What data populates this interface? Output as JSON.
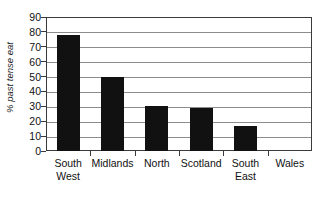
{
  "chart_data": {
    "type": "bar",
    "title": "",
    "subtitle": "",
    "xlabel": "",
    "ylabel": "% past tense eat",
    "categories": [
      "South West",
      "Midlands",
      "North",
      "Scotland",
      "South East",
      "Wales"
    ],
    "category_lines": [
      [
        "South",
        "West"
      ],
      [
        "Midlands",
        ""
      ],
      [
        "North",
        ""
      ],
      [
        "Scotland",
        ""
      ],
      [
        "South",
        "East"
      ],
      [
        "Wales",
        ""
      ]
    ],
    "values": [
      78,
      50,
      30,
      29,
      17,
      0
    ],
    "ylim": [
      0,
      90
    ],
    "ytick_step": 10,
    "ytick_labels": [
      "90",
      "80",
      "70",
      "60",
      "50",
      "40",
      "30",
      "20",
      "10",
      "0"
    ],
    "ytick_values": [
      90,
      80,
      70,
      60,
      50,
      40,
      30,
      20,
      10,
      0
    ],
    "grid": true,
    "grid_axis": "y",
    "legend": false,
    "legend_position": "none",
    "bar_color": "#111111",
    "grid_color": "#8c8c8c",
    "frame_color": "#3a3a3a",
    "background_color": "#ffffff",
    "text_color": "#111111"
  }
}
